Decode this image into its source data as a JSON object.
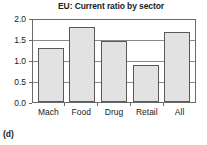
{
  "caption": "(d)",
  "chart_data": {
    "type": "bar",
    "title": "EU: Current ratio by sector",
    "xlabel": "",
    "ylabel": "",
    "categories": [
      "Mach",
      "Food",
      "Drug",
      "Retail",
      "All"
    ],
    "values": [
      1.31,
      1.84,
      1.49,
      0.91,
      1.7
    ],
    "ylim": [
      0.0,
      2.0
    ],
    "yticks": [
      "0.0",
      "0.5",
      "1.0",
      "1.5",
      "2.0"
    ],
    "ytick_values": [
      0.0,
      0.5,
      1.0,
      1.5,
      2.0
    ],
    "grid": true,
    "legend": "none",
    "bar_fill_color": "#e2e2e2",
    "bar_edge_color": "#595959",
    "axis_color": "#6b6b6b",
    "background_color": "#ffffff"
  }
}
